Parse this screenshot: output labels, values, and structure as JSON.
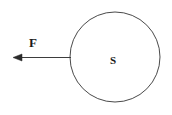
{
  "figure": {
    "type": "free-body-force-diagram",
    "background_color": "#ffffff",
    "stroke_color": "#4a4a4a",
    "text_color": "#1a1a1a",
    "labels": {
      "force_label": "F",
      "body_label": "S"
    },
    "shapes": {
      "circle": {
        "name": "sphere-outline",
        "center_x": 115,
        "center_y": 57,
        "radius": 45,
        "fill": "none",
        "stroke_width": 1
      },
      "arrow": {
        "name": "force-arrow",
        "direction": "left",
        "tail_x": 71,
        "tail_y": 57,
        "tip_x": 13,
        "tip_y": 57,
        "stroke_width": 1,
        "head_length": 9,
        "head_width": 7
      }
    },
    "label_positions": {
      "force_label_x": 33,
      "force_label_y": 47,
      "body_label_x": 113,
      "body_label_y": 64
    }
  }
}
